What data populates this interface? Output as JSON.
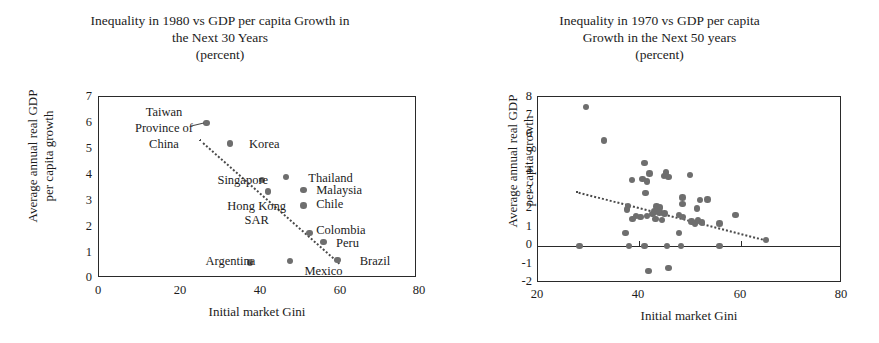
{
  "figure": {
    "panels": [
      {
        "id": "left",
        "title_lines": [
          "Inequality in 1980 vs GDP per capita Growth in",
          "the Next 30 Years",
          "(percent)"
        ],
        "xlabel": "Initial market Gini",
        "ylabel_lines": [
          "Average annual real GDP",
          "per capita growth"
        ],
        "xticks": [
          "0",
          "20",
          "40",
          "60",
          "80"
        ],
        "yticks": [
          "7",
          "6",
          "5",
          "4",
          "3",
          "2",
          "1",
          "0"
        ]
      },
      {
        "id": "right",
        "title_lines": [
          "Inequality in 1970 vs GDP per capita",
          "Growth in the Next 50 years",
          "(percent)"
        ],
        "xlabel": "Initial market Gini",
        "ylabel_lines": [
          "Average annual real GDP",
          "per capita growth"
        ],
        "xticks": [
          "20",
          "40",
          "60",
          "80"
        ],
        "yticks": [
          "8",
          "7",
          "6",
          "5",
          "4",
          "3",
          "2",
          "1",
          "0",
          "-1",
          "-2"
        ]
      }
    ],
    "marker_color": "#6e6e6e",
    "axis_color": "#2a2a2a",
    "trend_color": "#4a4a4a"
  },
  "chart_data": [
    {
      "type": "scatter",
      "title": "Inequality in 1980 vs GDP per capita Growth in the Next 30 Years (percent)",
      "xlabel": "Initial market Gini",
      "ylabel": "Average annual real GDP per capita growth",
      "xlim": [
        0,
        80
      ],
      "ylim": [
        0,
        7
      ],
      "xticks": [
        0,
        20,
        40,
        60,
        80
      ],
      "yticks": [
        0,
        1,
        2,
        3,
        4,
        5,
        6,
        7
      ],
      "grid": false,
      "legend": "none",
      "points": [
        {
          "label": "Taiwan Province of China",
          "x": 27.0,
          "y": 6.0
        },
        {
          "label": "Korea",
          "x": 33.0,
          "y": 5.2
        },
        {
          "label": "Singapore",
          "x": 41.0,
          "y": 3.8
        },
        {
          "label": "Hong Kong SAR",
          "x": 42.5,
          "y": 3.35
        },
        {
          "label": "Thailand",
          "x": 47.0,
          "y": 3.9
        },
        {
          "label": "Malaysia",
          "x": 51.5,
          "y": 3.4
        },
        {
          "label": "Chile",
          "x": 51.5,
          "y": 2.8
        },
        {
          "label": "Colombia",
          "x": 53.0,
          "y": 1.75
        },
        {
          "label": "Peru",
          "x": 56.5,
          "y": 1.4
        },
        {
          "label": "Brazil",
          "x": 60.0,
          "y": 0.7
        },
        {
          "label": "Argentina",
          "x": 38.0,
          "y": 0.6
        },
        {
          "label": "Mexico",
          "x": 48.0,
          "y": 0.65
        }
      ],
      "annotations": [
        {
          "text": "Taiwan Province of China",
          "x": 18,
          "y": 6.3
        },
        {
          "text": "Korea",
          "x": 38,
          "y": 5.15
        },
        {
          "text": "Singapore",
          "x": 31,
          "y": 3.75
        },
        {
          "text": "Thailand",
          "x": 53,
          "y": 3.85
        },
        {
          "text": "Malaysia",
          "x": 55,
          "y": 3.35
        },
        {
          "text": "Hong Kong SAR",
          "x": 33,
          "y": 2.75
        },
        {
          "text": "Chile",
          "x": 55,
          "y": 2.8
        },
        {
          "text": "Colombia",
          "x": 55,
          "y": 1.8
        },
        {
          "text": "Peru",
          "x": 60,
          "y": 1.3
        },
        {
          "text": "Argentina",
          "x": 28,
          "y": 0.6
        },
        {
          "text": "Mexico",
          "x": 52,
          "y": 0.2
        },
        {
          "text": "Brazil",
          "x": 66,
          "y": 0.6
        }
      ],
      "trendline": {
        "style": "dotted",
        "x0": 25.5,
        "y0": 5.35,
        "x1": 61.0,
        "y1": 0.55
      }
    },
    {
      "type": "scatter",
      "title": "Inequality in 1970 vs GDP per capita Growth in the Next 50 years (percent)",
      "xlabel": "Initial market Gini",
      "ylabel": "Average annual real GDP per capita growth",
      "xlim": [
        20,
        80
      ],
      "ylim": [
        -2,
        8
      ],
      "xticks": [
        20,
        40,
        60,
        80
      ],
      "yticks": [
        -2,
        -1,
        0,
        1,
        2,
        3,
        4,
        5,
        6,
        7,
        8
      ],
      "grid": false,
      "legend": "none",
      "zero_line": 0,
      "points": [
        {
          "x": 29.5,
          "y": 7.45
        },
        {
          "x": 33.0,
          "y": 5.65
        },
        {
          "x": 41.0,
          "y": 4.45
        },
        {
          "x": 45.3,
          "y": 3.95
        },
        {
          "x": 44.9,
          "y": 3.75
        },
        {
          "x": 45.8,
          "y": 3.7
        },
        {
          "x": 42.0,
          "y": 3.9
        },
        {
          "x": 50.0,
          "y": 3.8
        },
        {
          "x": 38.6,
          "y": 3.55
        },
        {
          "x": 40.6,
          "y": 3.6
        },
        {
          "x": 41.5,
          "y": 3.45
        },
        {
          "x": 41.2,
          "y": 2.85
        },
        {
          "x": 48.5,
          "y": 2.6
        },
        {
          "x": 52.0,
          "y": 2.45
        },
        {
          "x": 53.5,
          "y": 2.5
        },
        {
          "x": 48.5,
          "y": 2.25
        },
        {
          "x": 51.4,
          "y": 2.0
        },
        {
          "x": 37.8,
          "y": 2.15
        },
        {
          "x": 37.6,
          "y": 1.95
        },
        {
          "x": 43.5,
          "y": 2.1
        },
        {
          "x": 44.2,
          "y": 2.05
        },
        {
          "x": 43.0,
          "y": 1.85
        },
        {
          "x": 44.0,
          "y": 1.8
        },
        {
          "x": 45.0,
          "y": 1.75
        },
        {
          "x": 42.6,
          "y": 1.7
        },
        {
          "x": 41.5,
          "y": 1.6
        },
        {
          "x": 40.2,
          "y": 1.55
        },
        {
          "x": 39.3,
          "y": 1.6
        },
        {
          "x": 38.7,
          "y": 1.45
        },
        {
          "x": 43.2,
          "y": 1.45
        },
        {
          "x": 44.5,
          "y": 1.4
        },
        {
          "x": 47.8,
          "y": 1.65
        },
        {
          "x": 48.6,
          "y": 1.55
        },
        {
          "x": 50.3,
          "y": 1.3
        },
        {
          "x": 51.0,
          "y": 1.2
        },
        {
          "x": 51.6,
          "y": 1.35
        },
        {
          "x": 52.4,
          "y": 1.25
        },
        {
          "x": 55.8,
          "y": 1.2
        },
        {
          "x": 59.0,
          "y": 1.65
        },
        {
          "x": 37.3,
          "y": 0.7
        },
        {
          "x": 47.8,
          "y": 0.7
        },
        {
          "x": 65.0,
          "y": 0.3
        },
        {
          "x": 28.2,
          "y": -0.02
        },
        {
          "x": 38.0,
          "y": -0.02
        },
        {
          "x": 41.0,
          "y": -0.02
        },
        {
          "x": 45.5,
          "y": -0.02
        },
        {
          "x": 48.2,
          "y": -0.02
        },
        {
          "x": 55.8,
          "y": -0.02
        },
        {
          "x": 41.8,
          "y": -1.35
        },
        {
          "x": 45.8,
          "y": -1.2
        }
      ],
      "trendline": {
        "style": "dotted",
        "x0": 27.5,
        "y0": 2.95,
        "x1": 65.0,
        "y1": 0.35
      }
    }
  ]
}
